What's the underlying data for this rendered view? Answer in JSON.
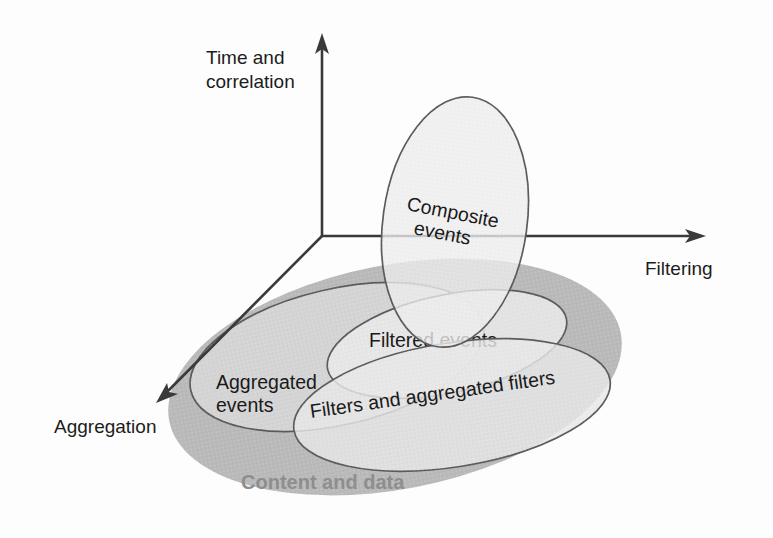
{
  "figure": {
    "background_color": "#fdfdfd"
  },
  "axes": [
    {
      "name": "vertical",
      "label": "Time and",
      "label_line2": "correlation",
      "direction": "up",
      "color": "#3a3a3a"
    },
    {
      "name": "horizontal",
      "label": "Filtering",
      "direction": "right",
      "color": "#3a3a3a"
    },
    {
      "name": "diagonal",
      "label": "Aggregation",
      "direction": "down-left",
      "color": "#3a3a3a"
    }
  ],
  "axis_labels": {
    "time_line1": "Time and",
    "time_line2": "correlation",
    "filtering": "Filtering",
    "aggregation": "Aggregation"
  },
  "regions": [
    {
      "id": "content-and-data",
      "label": "Content and data",
      "fill": "#b8b8b8",
      "outlined": false,
      "label_color": "#8e8e8e"
    },
    {
      "id": "composite-events",
      "label": "Composite",
      "label_line2": "events",
      "fill": "#e8e8e8",
      "outlined": true,
      "label_color": "#1a1a1a"
    },
    {
      "id": "aggregated-events",
      "label": "Aggregated",
      "label_line2": "events",
      "fill": "#d8d8d8",
      "outlined": true,
      "label_color": "#1a1a1a"
    },
    {
      "id": "filtered-events",
      "label": "Filtered events",
      "fill": "#e4e4e4",
      "outlined": true,
      "label_color": "#1a1a1a"
    },
    {
      "id": "filters-and-aggregated-filters",
      "label": "Filters and aggregated filters",
      "fill": "#e2e2e2",
      "outlined": true,
      "label_color": "#1a1a1a"
    }
  ],
  "region_labels": {
    "composite_line1": "Composite",
    "composite_line2": "events",
    "aggregated_line1": "Aggregated",
    "aggregated_line2": "events",
    "filtered": "Filtered events",
    "filters_aggregated": "Filters and aggregated filters",
    "content_and_data": "Content and data"
  },
  "colors": {
    "axis": "#3a3a3a",
    "outline": "#5a5a5a",
    "backdrop_fill": "#b8b8b8",
    "backdrop_text": "#8e8e8e",
    "text": "#1a1a1a"
  }
}
